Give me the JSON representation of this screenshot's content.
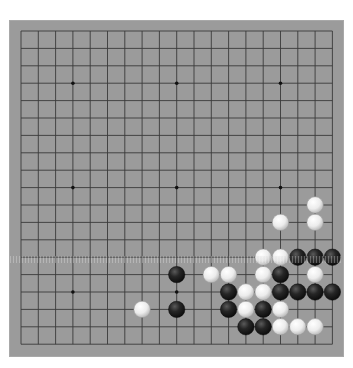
{
  "board": {
    "size": 19,
    "colors": {
      "background": "#9b9b9b",
      "line": "#3a3a3a",
      "star": "#111111",
      "black_stone": "#1e1e1e",
      "white_stone": "#f2f2f2"
    },
    "star_points": [
      [
        3,
        3
      ],
      [
        9,
        3
      ],
      [
        15,
        3
      ],
      [
        3,
        9
      ],
      [
        9,
        9
      ],
      [
        15,
        9
      ],
      [
        3,
        15
      ],
      [
        9,
        15
      ],
      [
        15,
        15
      ]
    ],
    "stones": [
      {
        "color": "white",
        "col": 17,
        "row": 10
      },
      {
        "color": "white",
        "col": 15,
        "row": 11
      },
      {
        "color": "white",
        "col": 17,
        "row": 11
      },
      {
        "color": "white",
        "col": 14,
        "row": 13
      },
      {
        "color": "white",
        "col": 15,
        "row": 13
      },
      {
        "color": "black",
        "col": 16,
        "row": 13
      },
      {
        "color": "black",
        "col": 17,
        "row": 13
      },
      {
        "color": "black",
        "col": 18,
        "row": 13
      },
      {
        "color": "black",
        "col": 9,
        "row": 14
      },
      {
        "color": "white",
        "col": 11,
        "row": 14
      },
      {
        "color": "white",
        "col": 12,
        "row": 14
      },
      {
        "color": "white",
        "col": 14,
        "row": 14
      },
      {
        "color": "black",
        "col": 15,
        "row": 14
      },
      {
        "color": "white",
        "col": 17,
        "row": 14
      },
      {
        "color": "black",
        "col": 12,
        "row": 15
      },
      {
        "color": "white",
        "col": 13,
        "row": 15
      },
      {
        "color": "white",
        "col": 14,
        "row": 15
      },
      {
        "color": "black",
        "col": 15,
        "row": 15
      },
      {
        "color": "black",
        "col": 16,
        "row": 15
      },
      {
        "color": "black",
        "col": 17,
        "row": 15
      },
      {
        "color": "black",
        "col": 18,
        "row": 15
      },
      {
        "color": "white",
        "col": 7,
        "row": 16
      },
      {
        "color": "black",
        "col": 9,
        "row": 16
      },
      {
        "color": "black",
        "col": 12,
        "row": 16
      },
      {
        "color": "white",
        "col": 13,
        "row": 16
      },
      {
        "color": "black",
        "col": 14,
        "row": 16
      },
      {
        "color": "white",
        "col": 15,
        "row": 16
      },
      {
        "color": "black",
        "col": 13,
        "row": 17
      },
      {
        "color": "black",
        "col": 14,
        "row": 17
      },
      {
        "color": "white",
        "col": 15,
        "row": 17
      },
      {
        "color": "white",
        "col": 16,
        "row": 17
      },
      {
        "color": "white",
        "col": 17,
        "row": 17
      }
    ]
  }
}
